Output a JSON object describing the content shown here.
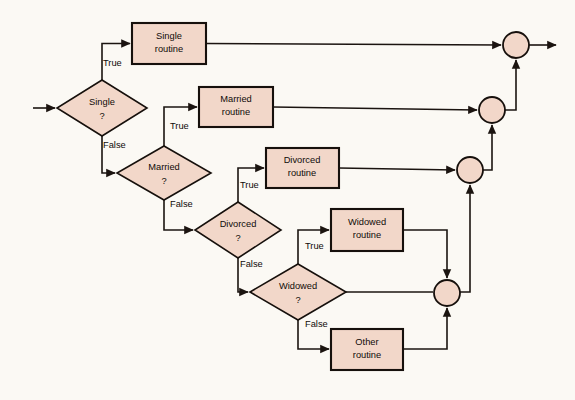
{
  "diagram": {
    "background_color": "#fbf9f4",
    "shape_fill_color": "#f2d7c9",
    "stroke_color": "#16100c",
    "decisions": [
      {
        "id": "single",
        "line1": "Single",
        "line2": "?",
        "cx": 102,
        "cy": 108,
        "rx": 45,
        "ry": 28
      },
      {
        "id": "married",
        "line1": "Married",
        "line2": "?",
        "cx": 164,
        "cy": 173,
        "rx": 47,
        "ry": 27
      },
      {
        "id": "divorced",
        "line1": "Divorced",
        "line2": "?",
        "cx": 238,
        "cy": 230,
        "rx": 43,
        "ry": 28
      },
      {
        "id": "widowed",
        "line1": "Widowed",
        "line2": "?",
        "cx": 298,
        "cy": 292,
        "rx": 48,
        "ry": 28
      }
    ],
    "processes": [
      {
        "id": "single-routine",
        "line1": "Single",
        "line2": "routine",
        "x": 132,
        "y": 23,
        "w": 74,
        "h": 41
      },
      {
        "id": "married-routine",
        "line1": "Married",
        "line2": "routine",
        "x": 199,
        "y": 87,
        "w": 74,
        "h": 40
      },
      {
        "id": "divorced-routine",
        "line1": "Divorced",
        "line2": "routine",
        "x": 266,
        "y": 148,
        "w": 73,
        "h": 40
      },
      {
        "id": "widowed-routine",
        "line1": "Widowed",
        "line2": "routine",
        "x": 331,
        "y": 209,
        "w": 72,
        "h": 42
      },
      {
        "id": "other-routine",
        "line1": "Other",
        "line2": "routine",
        "x": 331,
        "y": 329,
        "w": 72,
        "h": 41
      }
    ],
    "junctions": [
      {
        "id": "junction-1",
        "cx": 516,
        "cy": 45,
        "r": 13
      },
      {
        "id": "junction-2",
        "cx": 492,
        "cy": 110,
        "r": 13
      },
      {
        "id": "junction-3",
        "cx": 470,
        "cy": 170,
        "r": 13
      },
      {
        "id": "junction-4",
        "cx": 447,
        "cy": 293,
        "r": 13
      }
    ],
    "edge_labels": [
      {
        "id": "single-true",
        "text": "True",
        "x": 103,
        "y": 64
      },
      {
        "id": "single-false",
        "text": "False",
        "x": 103,
        "y": 146
      },
      {
        "id": "married-true",
        "text": "True",
        "x": 170,
        "y": 127
      },
      {
        "id": "married-false",
        "text": "False",
        "x": 170,
        "y": 205
      },
      {
        "id": "divorced-true",
        "text": "True",
        "x": 240,
        "y": 186
      },
      {
        "id": "divorced-false",
        "text": "False",
        "x": 240,
        "y": 265
      },
      {
        "id": "widowed-true",
        "text": "True",
        "x": 305,
        "y": 247
      },
      {
        "id": "widowed-false",
        "text": "False",
        "x": 305,
        "y": 325
      }
    ],
    "entry": {
      "id": "entry-arrow",
      "from_x": 33,
      "to_x": 57,
      "y": 108
    },
    "exit": {
      "id": "exit-arrow",
      "from_x": 529,
      "to_x": 558,
      "y": 45
    }
  }
}
